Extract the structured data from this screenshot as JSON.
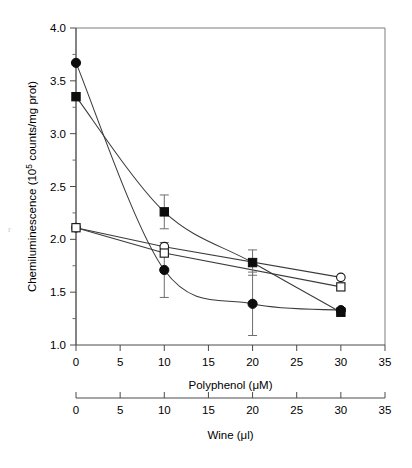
{
  "chart_data": {
    "type": "line",
    "title": "",
    "xlabel": "Polyphenol (μM)",
    "ylabel": "Chemiluminescence (10⁵ counts/mg prot)",
    "secondary_xlabel": "Wine (μl)",
    "xlim": [
      0,
      35
    ],
    "ylim": [
      1.0,
      4.0
    ],
    "secondary_xlim": [
      0,
      35
    ],
    "xticks": [
      0,
      5,
      10,
      15,
      20,
      25,
      30,
      35
    ],
    "xtick_labels": [
      "0",
      "5",
      "10",
      "15",
      "20",
      "25",
      "30",
      "35"
    ],
    "yticks": [
      1.0,
      1.5,
      2.0,
      2.5,
      3.0,
      3.5,
      4.0
    ],
    "ytick_labels": [
      "1.0",
      "1.5",
      "2.0",
      "2.5",
      "3.0",
      "3.5",
      "4.0"
    ],
    "y_minor_ticks": [
      1.25,
      1.75,
      2.25,
      2.75,
      3.25,
      3.75
    ],
    "secondary_xticks": [
      0,
      5,
      10,
      15,
      20,
      25,
      30,
      35
    ],
    "secondary_xtick_labels": [
      "0",
      "5",
      "10",
      "15",
      "20",
      "25",
      "30",
      "35"
    ],
    "grid": false,
    "legend": "none",
    "series": [
      {
        "name": "filled-circle",
        "marker": "filled-circle",
        "curve": "smooth",
        "x": [
          0,
          10,
          20,
          30
        ],
        "values": [
          3.67,
          1.71,
          1.39,
          1.33
        ],
        "errors": [
          0.0,
          0.26,
          0.3,
          0.0
        ]
      },
      {
        "name": "filled-square",
        "marker": "filled-square",
        "curve": "smooth",
        "x": [
          0,
          10,
          20,
          30
        ],
        "values": [
          3.35,
          2.26,
          1.78,
          1.31
        ],
        "errors": [
          0.0,
          0.16,
          0.12,
          0.0
        ]
      },
      {
        "name": "open-circle",
        "marker": "open-circle",
        "curve": "linear",
        "x": [
          0,
          10,
          30
        ],
        "values": [
          2.11,
          1.93,
          1.64
        ],
        "errors": [
          0.0,
          0.0,
          0.0
        ]
      },
      {
        "name": "open-square",
        "marker": "open-square",
        "curve": "linear",
        "x": [
          0,
          10,
          30
        ],
        "values": [
          2.11,
          1.87,
          1.55
        ],
        "errors": [
          0.0,
          0.0,
          0.0
        ]
      }
    ]
  },
  "figure": {
    "artifact_mark": "r"
  }
}
